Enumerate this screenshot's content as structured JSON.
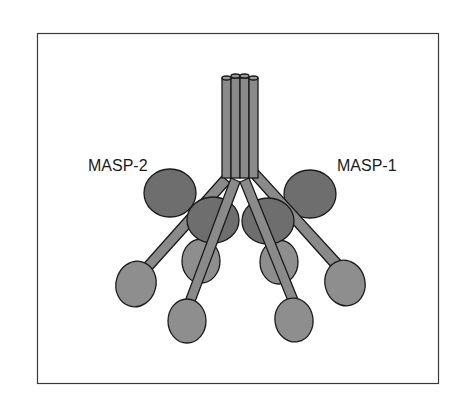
{
  "figure": {
    "labels": {
      "left": "MASP-2",
      "right": "MASP-1"
    },
    "colors": {
      "background": "#ffffff",
      "frame": "#3a3a3a",
      "outline": "#1a1a1a",
      "stem": "#8a8a8a",
      "dark_domain": "#6e6e6e",
      "light_domain": "#8e8e8e"
    }
  }
}
